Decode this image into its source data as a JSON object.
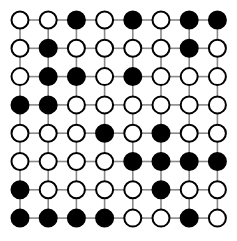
{
  "figure": {
    "type": "diagram",
    "width": 237,
    "height": 241,
    "background_color": "#ffffff"
  },
  "chart_data": {
    "type": "heatmap",
    "title": "",
    "xlabel": "",
    "ylabel": "",
    "rows": 8,
    "columns": 8,
    "legend": [
      {
        "key": "filled",
        "label": "filled vertex",
        "color": "#000000"
      },
      {
        "key": "empty",
        "label": "empty vertex",
        "color": "#ffffff"
      }
    ],
    "values": [
      [
        0,
        0,
        1,
        0,
        1,
        0,
        1,
        1
      ],
      [
        0,
        1,
        0,
        0,
        0,
        0,
        1,
        0
      ],
      [
        0,
        1,
        1,
        0,
        1,
        0,
        0,
        0
      ],
      [
        1,
        1,
        0,
        0,
        0,
        0,
        0,
        0
      ],
      [
        0,
        0,
        0,
        1,
        0,
        1,
        0,
        0
      ],
      [
        0,
        0,
        0,
        0,
        1,
        1,
        1,
        1
      ],
      [
        1,
        0,
        0,
        0,
        0,
        1,
        0,
        0
      ],
      [
        1,
        1,
        1,
        1,
        0,
        0,
        1,
        0
      ]
    ]
  },
  "style": {
    "node_stroke_color": "#000000",
    "node_fill_black": "#000000",
    "node_fill_white": "#ffffff",
    "node_stroke_width": 2,
    "node_radius": 8.5,
    "edge_color": "#8a8a8a",
    "edge_width": 1.6
  },
  "geometry": {
    "origin_x": 20,
    "origin_y": 20,
    "step_x": 28.2,
    "step_y": 28.3
  }
}
